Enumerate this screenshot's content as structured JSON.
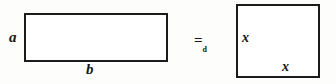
{
  "figure": {
    "type": "geometry-equivalence-diagram",
    "background_color": "#fdfdfc",
    "stroke_color": "#1b1b1b",
    "left_shape": {
      "name": "rectangle",
      "side_label_left": "a",
      "side_label_bottom": "b"
    },
    "relation": {
      "operator": "=",
      "subscript": "d",
      "full": "=d"
    },
    "right_shape": {
      "name": "square",
      "side_label_left": "x",
      "side_label_bottom": "x"
    }
  }
}
